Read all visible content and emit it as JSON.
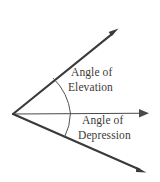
{
  "diagram": {
    "background_color": "#ffffff",
    "line_color": "#3a3a3a",
    "arc_color": "#55524f",
    "text_color": "#3d3a38",
    "vertex": {
      "x": 13,
      "y": 114
    },
    "rays": [
      {
        "name": "elevation-ray",
        "from": {
          "x": 13,
          "y": 114
        },
        "to": {
          "x": 117,
          "y": 30
        },
        "weight": "thick",
        "arrowhead": true
      },
      {
        "name": "horizontal-ray",
        "from": {
          "x": 13,
          "y": 114
        },
        "to": {
          "x": 148,
          "y": 113
        },
        "weight": "thin",
        "arrowhead": true
      },
      {
        "name": "depression-ray",
        "from": {
          "x": 13,
          "y": 114
        },
        "to": {
          "x": 145,
          "y": 172
        },
        "weight": "thick",
        "arrowhead": true
      }
    ],
    "arcs": [
      {
        "name": "elevation-arc",
        "start": {
          "x": 53,
          "y": 79
        },
        "end": {
          "x": 70,
          "y": 113
        },
        "radius": 58
      },
      {
        "name": "depression-arc",
        "start": {
          "x": 70,
          "y": 113
        },
        "end": {
          "x": 64,
          "y": 137
        },
        "radius": 57
      }
    ],
    "labels": {
      "elevation": {
        "line1": "Angle of",
        "line2": "Elevation"
      },
      "depression": {
        "line1": "Angle of",
        "line2": "Depression"
      }
    }
  }
}
